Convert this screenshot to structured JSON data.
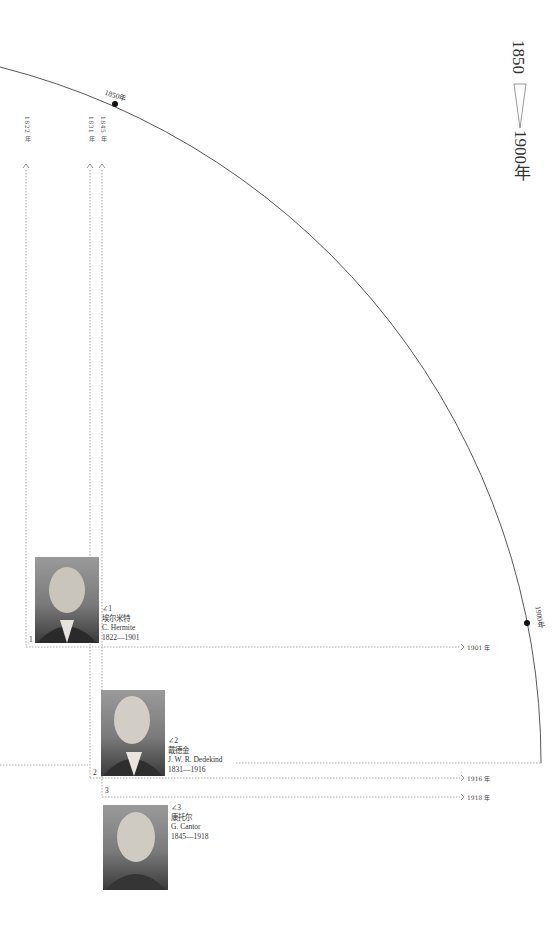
{
  "title": {
    "start_year": "1850",
    "end_year": "1900年"
  },
  "timeline_arc": {
    "marks": [
      {
        "label": "1850年",
        "year": 1850
      },
      {
        "label": "1900年",
        "year": 1900
      }
    ],
    "color": "#333333"
  },
  "birth_markers": [
    {
      "label": "1822 年",
      "year": 1822
    },
    {
      "label": "1831 年",
      "year": 1831
    },
    {
      "label": "1845 年",
      "year": 1845
    }
  ],
  "death_markers": [
    {
      "label": "1901 年",
      "year": 1901
    },
    {
      "label": "1916 年",
      "year": 1916
    },
    {
      "label": "1918 年",
      "year": 1918
    }
  ],
  "mathematicians": [
    {
      "index": "1",
      "ref": "∠1",
      "name_zh": "埃尔米特",
      "name_en": "C. Hermite",
      "years": "1822—1901"
    },
    {
      "index": "2",
      "ref": "∠2",
      "name_zh": "戴德金",
      "name_en": "J. W. R. Dedekind",
      "years": "1831—1916"
    },
    {
      "index": "3",
      "ref": "∠3",
      "name_zh": "康托尔",
      "name_en": "G. Cantor",
      "years": "1845—1918"
    }
  ]
}
